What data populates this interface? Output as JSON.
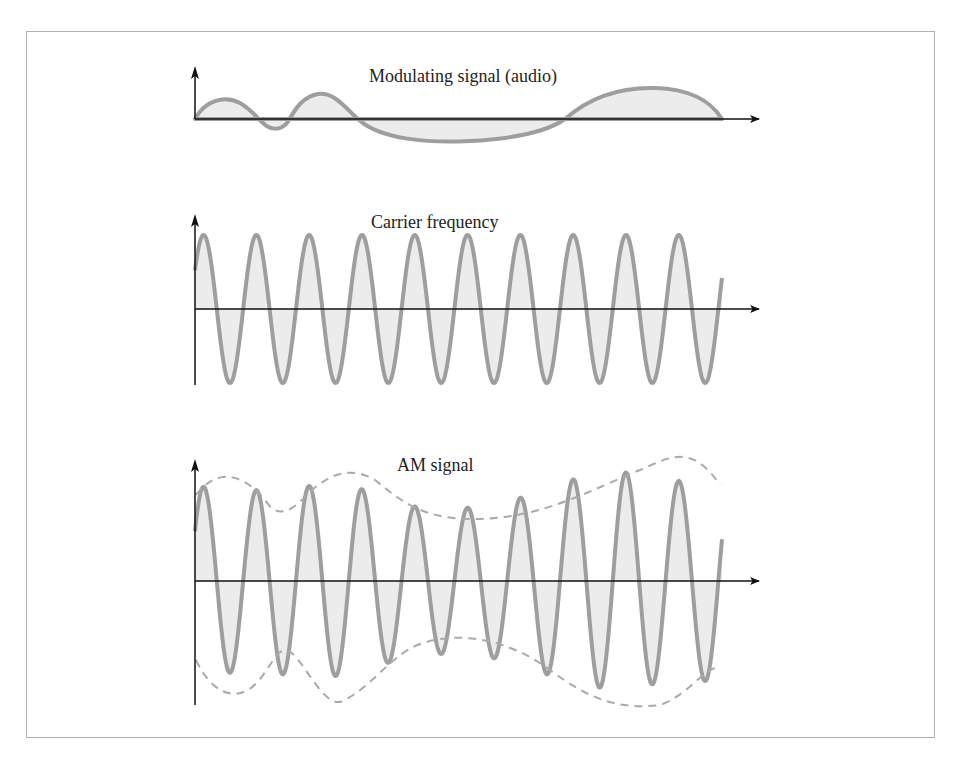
{
  "panels": [
    {
      "title": "Modulating signal (audio)"
    },
    {
      "title": "Carrier frequency"
    },
    {
      "title": "AM signal"
    }
  ],
  "colors": {
    "wave_stroke": "#9e9e9e",
    "wave_fill": "#ececec",
    "axis": "#111111",
    "frame": "#b0b0b0"
  },
  "chart_data": [
    {
      "type": "line",
      "title": "Modulating signal (audio)",
      "description": "Low-frequency audio waveform, irregular amplitude",
      "x": [
        0,
        0.1,
        0.15,
        0.2,
        0.26,
        0.35,
        0.45,
        0.55,
        0.65,
        0.75,
        0.88,
        1.0
      ],
      "y": [
        0,
        0.55,
        0,
        -0.3,
        0.6,
        0,
        -0.55,
        -0.6,
        0,
        0.75,
        0.6,
        0
      ]
    },
    {
      "type": "line",
      "title": "Carrier frequency",
      "description": "Constant-amplitude high-frequency sine wave, ~10 cycles",
      "cycles": 10,
      "amplitude": 1
    },
    {
      "type": "line",
      "title": "AM signal",
      "description": "Carrier whose amplitude follows the modulating signal envelope (dashed)",
      "cycles": 10,
      "peak_amplitudes": [
        0.95,
        0.9,
        0.95,
        0.95,
        0.75,
        0.72,
        0.8,
        1.0,
        1.1,
        1.0
      ]
    }
  ]
}
